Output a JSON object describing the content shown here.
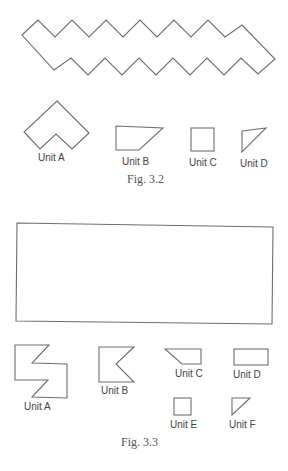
{
  "figures": [
    {
      "caption": "Fig. 3.2",
      "target_shape": "zigzag-band",
      "units": [
        {
          "label": "Unit A"
        },
        {
          "label": "Unit B"
        },
        {
          "label": "Unit C"
        },
        {
          "label": "Unit D"
        }
      ]
    },
    {
      "caption": "Fig. 3.3",
      "target_shape": "rectangle",
      "units": [
        {
          "label": "Unit A"
        },
        {
          "label": "Unit B"
        },
        {
          "label": "Unit C"
        },
        {
          "label": "Unit D"
        },
        {
          "label": "Unit E"
        },
        {
          "label": "Unit F"
        }
      ]
    }
  ],
  "colors": {
    "stroke": "#6e6e6e",
    "text": "#444444",
    "background": "#ffffff"
  }
}
